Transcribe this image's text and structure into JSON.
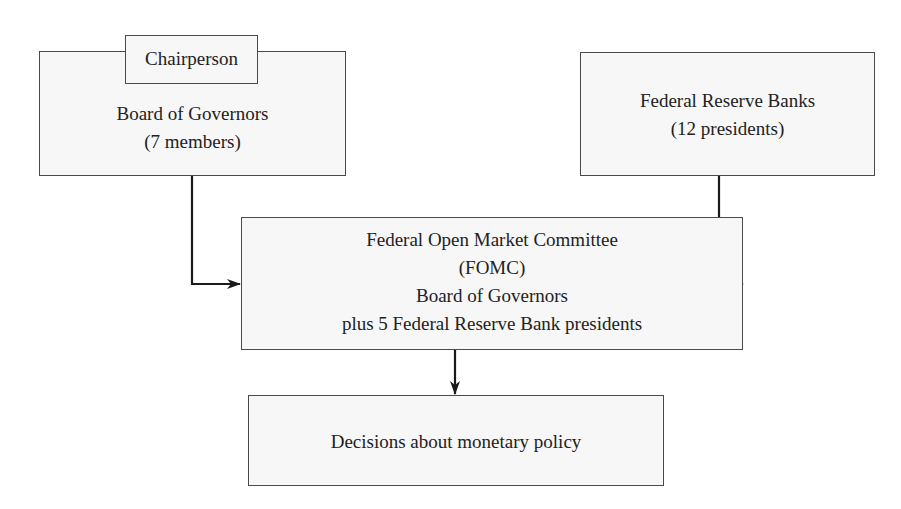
{
  "diagram": {
    "type": "flowchart",
    "nodes": {
      "board": {
        "tab_label": "Chairperson",
        "line1": "Board of Governors",
        "line2": "(7 members)"
      },
      "banks": {
        "line1": "Federal Reserve Banks",
        "line2": "(12 presidents)"
      },
      "fomc": {
        "line1": "Federal Open Market Committee",
        "line2": "(FOMC)",
        "line3": "Board of Governors",
        "line4": "plus 5 Federal Reserve Bank presidents"
      },
      "decisions": {
        "line1": "Decisions about monetary policy"
      }
    },
    "edges": [
      {
        "from": "board",
        "to": "fomc"
      },
      {
        "from": "banks",
        "to": "fomc"
      },
      {
        "from": "fomc",
        "to": "decisions"
      }
    ],
    "colors": {
      "box_fill": "#f7f7f7",
      "box_border": "#4a4a4a",
      "line": "#1a1a1a",
      "text": "#222222"
    }
  }
}
